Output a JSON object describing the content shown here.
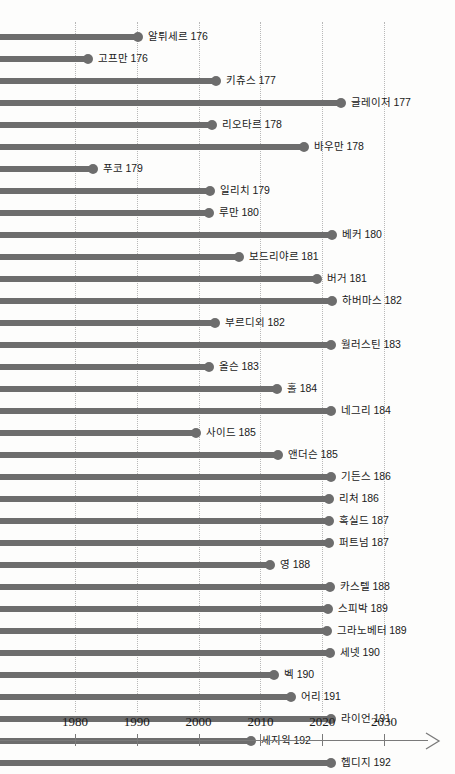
{
  "chart_data": {
    "type": "bar",
    "orientation": "horizontal",
    "title": "",
    "xlabel": "",
    "ylabel": "",
    "xlim": [
      1967,
      2035
    ],
    "grid": true,
    "legend": null,
    "tick_labels": [
      "1980",
      "1990",
      "2000",
      "2010",
      "2020",
      "2030"
    ],
    "tick_values": [
      1980,
      1990,
      2000,
      2010,
      2020,
      2030
    ],
    "categories": [
      "알튀세르 176",
      "고프만 176",
      "키츄스  177",
      "글레이저 177",
      "리오타르 178",
      "바우만 178",
      "푸코 179",
      "일리치 179",
      "루만 180",
      "베커 180",
      "보드리야르 181",
      "버거 181",
      "하버마스 182",
      "부르디외 182",
      "월러스틴 183",
      "올슨 183",
      "홀 184",
      "네그리 184",
      "사이드 185",
      "앤더슨 185",
      "기든스 186",
      "리처 186",
      "혹실드 187",
      "퍼트넘 187",
      "영 188",
      "카스텔 188",
      "스피박 189",
      "그라노베터 189",
      "세넷 190",
      "벡 190",
      "어리 191",
      "라이언 191",
      "세지윅 192",
      "헵디지 192",
      "버틀러 193",
      "허트 93"
    ],
    "values": [
      1990,
      1982,
      2003,
      2023,
      1999,
      2018,
      1980,
      2002,
      1999,
      2022,
      2005,
      2020,
      2022,
      2001,
      2022,
      1999,
      2014,
      2022,
      1996,
      2014,
      2022,
      2022,
      2022,
      2022,
      2013,
      2022,
      2022,
      2022,
      2022,
      2014,
      2016,
      2022,
      2010,
      2022,
      2022,
      2022
    ],
    "bar_end_px": [
      140,
      90,
      218,
      343,
      214,
      306,
      95,
      212,
      211,
      334,
      241,
      319,
      334,
      217,
      333,
      211,
      279,
      333,
      198,
      280,
      333,
      331,
      331,
      331,
      272,
      332,
      330,
      329,
      332,
      276,
      293,
      333,
      253,
      333,
      333,
      331
    ]
  },
  "style": {
    "bar_color": "#6d6d6d",
    "grid_color": "#b8b8b8",
    "axis_color": "#7a7a7a",
    "text_color": "#1a1a1a",
    "background": "#fdfdfc"
  }
}
